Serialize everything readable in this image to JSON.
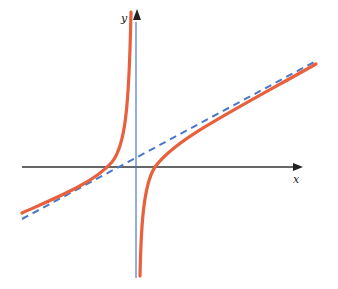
{
  "diagram": {
    "type": "function-graph",
    "axes": {
      "x_label": "x",
      "y_label": "y"
    },
    "colors": {
      "curve": "#e8603c",
      "asymptote": "#4a78c8",
      "axes": "#222222",
      "y_axis_near": "#4a78c8"
    },
    "elements": [
      {
        "name": "curve-left-branch",
        "style": "solid"
      },
      {
        "name": "curve-right-branch",
        "style": "solid"
      },
      {
        "name": "slant-asymptote",
        "style": "dashed"
      }
    ]
  }
}
